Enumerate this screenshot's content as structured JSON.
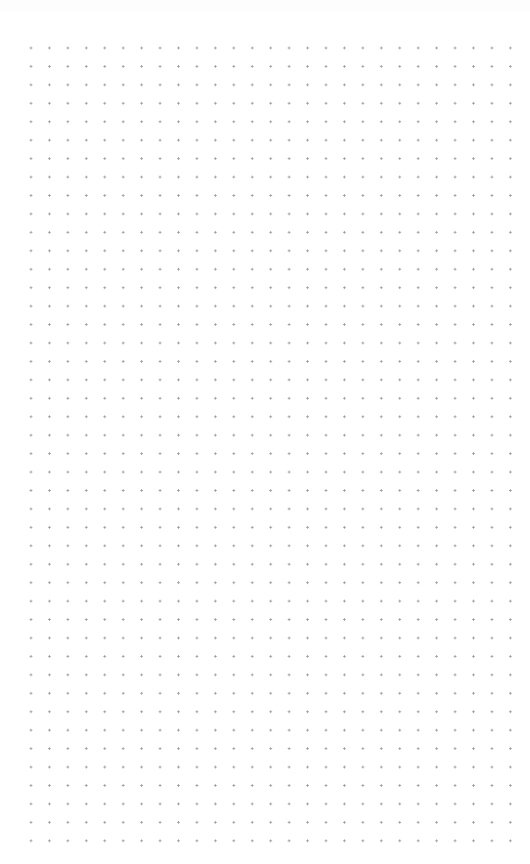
{
  "canvas": {
    "type": "dot-grid",
    "background_color": "#ffffff",
    "dot_color": "#9a9a9a",
    "dot_spacing_px": 18.45,
    "first_dot": {
      "x": 31,
      "y": 48
    },
    "last_dot": {
      "x": 512,
      "y": 843
    },
    "columns": 27,
    "rows": 44
  }
}
